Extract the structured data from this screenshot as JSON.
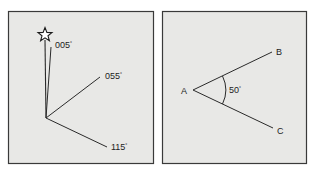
{
  "colors": {
    "panel_fill": "#e8e8e6",
    "panel_border": "#3a3a3a",
    "line": "#2a2a2a",
    "background": "#ffffff"
  },
  "left_panel": {
    "description": "Bearings from a point relative to north",
    "north_icon": "star-icon",
    "bearings": [
      {
        "label": "005",
        "degree_symbol": "°"
      },
      {
        "label": "055",
        "degree_symbol": "°"
      },
      {
        "label": "115",
        "degree_symbol": "°"
      }
    ]
  },
  "right_panel": {
    "description": "Angle between two rays",
    "vertex": "A",
    "ray_ends": [
      "B",
      "C"
    ],
    "angle_label": "50",
    "degree_symbol": "°"
  }
}
